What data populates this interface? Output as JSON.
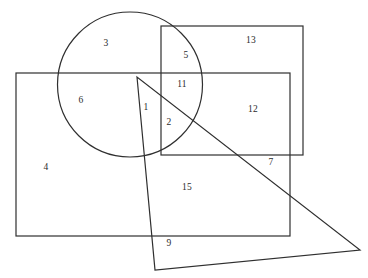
{
  "figure": {
    "background_color": "#ffffff",
    "stroke_color": "#2f2f2f",
    "label_color": "#2b2b2b",
    "stroke_width": 1.2,
    "width": 368,
    "height": 278
  },
  "shapes": {
    "circle": {
      "name": "circle",
      "cx": 130,
      "cy": 84.5,
      "r": 72.5
    },
    "rect_large": {
      "name": "large-rectangle",
      "x": 16,
      "y": 73,
      "width": 274,
      "height": 163
    },
    "rect_upper": {
      "name": "upper-right-rectangle",
      "x": 161,
      "y": 26,
      "width": 142,
      "height": 129
    },
    "triangle": {
      "name": "triangle",
      "points": "137,77 155,270 360,250"
    }
  },
  "labels": [
    {
      "text": "3",
      "x": 106,
      "y": 44,
      "region": "circle-only-top"
    },
    {
      "text": "5",
      "x": 186,
      "y": 56,
      "region": "circle-and-upper-rect"
    },
    {
      "text": "13",
      "x": 251,
      "y": 41,
      "region": "upper-rect-only"
    },
    {
      "text": "11",
      "x": 182,
      "y": 85,
      "region": "circle-upper-rect-large-rect"
    },
    {
      "text": "6",
      "x": 81,
      "y": 101,
      "region": "circle-and-large-rect"
    },
    {
      "text": "1",
      "x": 146,
      "y": 108,
      "region": "triangle-circle-large-rect"
    },
    {
      "text": "12",
      "x": 253,
      "y": 110,
      "region": "upper-rect-and-large-rect"
    },
    {
      "text": "2",
      "x": 169,
      "y": 123,
      "region": "circle-upper-large-triangle"
    },
    {
      "text": "7",
      "x": 271,
      "y": 163,
      "region": "large-rect-and-triangle-right"
    },
    {
      "text": "4",
      "x": 46,
      "y": 168,
      "region": "large-rect-only-left"
    },
    {
      "text": "15",
      "x": 187,
      "y": 188,
      "region": "large-rect-and-triangle"
    },
    {
      "text": "9",
      "x": 169,
      "y": 244,
      "region": "triangle-only-bottom"
    }
  ],
  "artifacts": {
    "top_text": ""
  }
}
